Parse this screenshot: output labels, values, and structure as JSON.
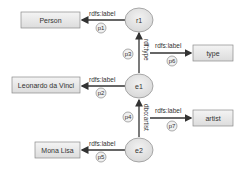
{
  "diagram": {
    "nodes": [
      {
        "id": "r1",
        "label": "r1",
        "cx": 139,
        "cy": 20
      },
      {
        "id": "e1",
        "label": "e1",
        "cx": 139,
        "cy": 86
      },
      {
        "id": "e2",
        "label": "e2",
        "cx": 139,
        "cy": 150
      }
    ],
    "literals": [
      {
        "id": "person",
        "label": "Person"
      },
      {
        "id": "leonardo",
        "label": "Leonardo da Vinci"
      },
      {
        "id": "monalisa",
        "label": "Mona Lisa"
      },
      {
        "id": "type",
        "label": "type"
      },
      {
        "id": "artist",
        "label": "artist"
      }
    ],
    "edges": [
      {
        "id": "p1",
        "from": "r1",
        "to": "Person",
        "label": "rdfs:label",
        "tag": "p1"
      },
      {
        "id": "p2",
        "from": "e1",
        "to": "Leonardo da Vinci",
        "label": "rdfs:label",
        "tag": "p2"
      },
      {
        "id": "p3",
        "from": "e1",
        "to": "r1",
        "label": "rdf:type",
        "tag": "p3"
      },
      {
        "id": "p4",
        "from": "e2",
        "to": "e1",
        "label": "dbo:artist",
        "tag": "p4"
      },
      {
        "id": "p5",
        "from": "e2",
        "to": "Mona Lisa",
        "label": "rdfs:label",
        "tag": "p5"
      },
      {
        "id": "p6",
        "from": "rdf:type",
        "to": "type",
        "label": "rdfs:label",
        "tag": "p6"
      },
      {
        "id": "p7",
        "from": "dbo:artist",
        "to": "artist",
        "label": "rdfs:label",
        "tag": "p7"
      }
    ],
    "colors": {
      "node_fill": "#e6e6e6",
      "box_fill": "#e8e8e8",
      "stroke": "#8a8a8a",
      "edge": "#333333"
    }
  }
}
